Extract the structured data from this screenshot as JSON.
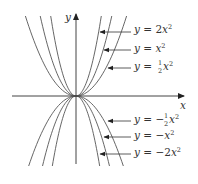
{
  "figure": {
    "axes": {
      "x_label": "x",
      "y_label": "y",
      "origin_px": [
        76,
        96
      ],
      "scale_px_per_unit": 16,
      "x_range_px": [
        12,
        184
      ],
      "y_range_px": [
        14,
        164
      ],
      "axis_color": "#444444",
      "curve_color": "#555555"
    },
    "curves": [
      {
        "id": "2x2",
        "coef": 2,
        "label": {
          "prefix": "y = ",
          "coef_text": "2",
          "var": "x",
          "frac": null,
          "neg": false
        },
        "label_y": 33,
        "arrow_from_x": 100,
        "arrow_y": 32
      },
      {
        "id": "x2",
        "coef": 1,
        "label": {
          "prefix": "y = ",
          "coef_text": "",
          "var": "x",
          "frac": null,
          "neg": false
        },
        "label_y": 52,
        "arrow_from_x": 104,
        "arrow_y": 50
      },
      {
        "id": "half_x2",
        "coef": 0.5,
        "label": {
          "prefix": "y = ",
          "coef_text": "",
          "var": "x",
          "frac": [
            "1",
            "2"
          ],
          "neg": false
        },
        "label_y": 70,
        "arrow_from_x": 108,
        "arrow_y": 68
      },
      {
        "id": "neg_half_x2",
        "coef": -0.5,
        "label": {
          "prefix": "y = −",
          "coef_text": "",
          "var": "x",
          "frac": [
            "1",
            "2"
          ],
          "neg": true
        },
        "label_y": 123,
        "arrow_from_x": 108,
        "arrow_y": 121
      },
      {
        "id": "neg_x2",
        "coef": -1,
        "label": {
          "prefix": "y = −",
          "coef_text": "",
          "var": "x",
          "frac": null,
          "neg": true
        },
        "label_y": 139,
        "arrow_from_x": 104,
        "arrow_y": 137
      },
      {
        "id": "neg_2x2",
        "coef": -2,
        "label": {
          "prefix": "y = −",
          "coef_text": "2",
          "var": "x",
          "frac": null,
          "neg": true
        },
        "label_y": 156,
        "arrow_from_x": 100,
        "arrow_y": 154
      }
    ],
    "labels": [
      "y = 2x²",
      "y = x²",
      "y = ½x²",
      "y = −½x²",
      "y = −x²",
      "y = −2x²"
    ]
  }
}
